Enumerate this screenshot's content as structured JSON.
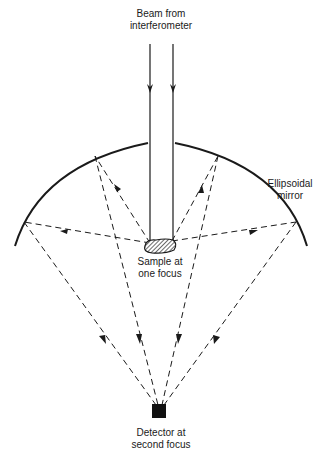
{
  "diagram": {
    "labels": {
      "beam": [
        "Beam from",
        "interferometer"
      ],
      "mirror": [
        "Ellipsoidal",
        "mirror"
      ],
      "sample": [
        "Sample at",
        "one focus"
      ],
      "detector": [
        "Detector at",
        "second focus"
      ]
    },
    "colors": {
      "line": "#1a1a1a",
      "background": "#ffffff"
    },
    "elements": [
      {
        "id": "beam",
        "type": "parallel-rays",
        "direction": "down"
      },
      {
        "id": "mirror",
        "type": "ellipsoidal-arc",
        "has_center_gap": true
      },
      {
        "id": "sample",
        "type": "hatched-blob",
        "position": "first focus"
      },
      {
        "id": "detector",
        "type": "filled-square",
        "position": "second focus"
      },
      {
        "id": "rays",
        "type": "dashed-arrows",
        "count_outgoing": 4,
        "count_converging": 4
      }
    ]
  }
}
